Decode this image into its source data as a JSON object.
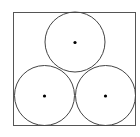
{
  "diagram": {
    "square": {
      "x": 13.5,
      "y": 12.5,
      "width": 122,
      "height": 113,
      "stroke": "#555555"
    },
    "circles": [
      {
        "name": "top-circle",
        "cx": 75,
        "cy": 42,
        "r": 30
      },
      {
        "name": "bottom-left-circle",
        "cx": 44.5,
        "cy": 95.5,
        "r": 30
      },
      {
        "name": "bottom-right-circle",
        "cx": 105.5,
        "cy": 95.5,
        "r": 30
      }
    ],
    "stroke_color": "#444444",
    "center_dot_color": "#000000"
  }
}
